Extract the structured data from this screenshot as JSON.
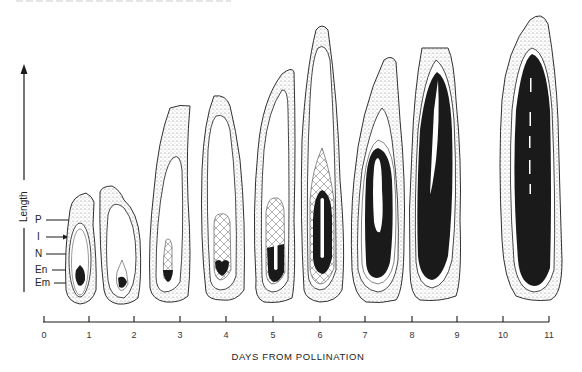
{
  "figure": {
    "caption_fragment_visible": true,
    "y_axis": {
      "label": "Length",
      "arrow": "up"
    },
    "x_axis": {
      "title": "DAYS FROM POLLINATION",
      "ticks": [
        "0",
        "1",
        "2",
        "3",
        "4",
        "5",
        "6",
        "7",
        "8",
        "9",
        "10",
        "11"
      ]
    },
    "part_labels": [
      {
        "abbr": "P"
      },
      {
        "abbr": "I"
      },
      {
        "abbr": "N"
      },
      {
        "abbr": "En"
      },
      {
        "abbr": "Em"
      }
    ],
    "kernels": [
      {
        "stage": "day 1"
      },
      {
        "stage": "day 2"
      },
      {
        "stage": "day 3"
      },
      {
        "stage": "day 4"
      },
      {
        "stage": "day 5"
      },
      {
        "stage": "day 6"
      },
      {
        "stage": "day 7"
      },
      {
        "stage": "day 8-9"
      },
      {
        "stage": "day 10-11"
      }
    ]
  },
  "colors": {
    "ink": "#1a1a1a",
    "stipple": "#9a9a9a",
    "background": "#ffffff"
  }
}
